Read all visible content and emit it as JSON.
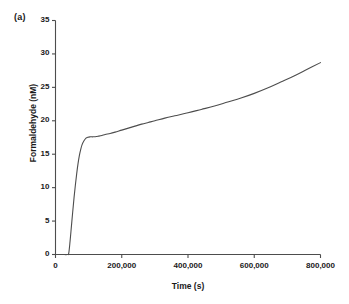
{
  "panel": {
    "label": "(a)"
  },
  "chart_data": {
    "type": "line",
    "title": "",
    "subtitle": "",
    "xlabel": "Time (s)",
    "ylabel": "Formaldehyde (nM)",
    "xlim": [
      0,
      800000
    ],
    "ylim": [
      0,
      35
    ],
    "xticks": [
      0,
      200000,
      400000,
      600000,
      800000
    ],
    "xtick_labels": [
      "0",
      "200,000",
      "400,000",
      "600,000",
      "800,000"
    ],
    "yticks": [
      0,
      5,
      10,
      15,
      20,
      25,
      30,
      35
    ],
    "ytick_labels": [
      "0",
      "5",
      "10",
      "15",
      "20",
      "25",
      "30",
      "35"
    ],
    "grid": false,
    "legend": null,
    "annotations": [],
    "line_color": "#4d4d4d",
    "line_width": 1.1,
    "series": [
      {
        "name": "Formaldehyde",
        "x": [
          0,
          20000,
          36000,
          40000,
          44000,
          48000,
          52000,
          56000,
          60000,
          64000,
          68000,
          72000,
          76000,
          80000,
          86000,
          92000,
          98000,
          104000,
          112000,
          120000,
          130000,
          140000,
          150000,
          165000,
          180000,
          200000,
          220000,
          240000,
          260000,
          280000,
          300000,
          330000,
          360000,
          400000,
          440000,
          480000,
          520000,
          560000,
          600000,
          640000,
          680000,
          720000,
          760000,
          800000
        ],
        "y": [
          0,
          0,
          0,
          0.2,
          2.0,
          4.2,
          6.4,
          8.5,
          10.4,
          12.1,
          13.6,
          14.8,
          15.7,
          16.4,
          17.0,
          17.4,
          17.55,
          17.6,
          17.6,
          17.62,
          17.7,
          17.8,
          17.95,
          18.1,
          18.3,
          18.6,
          18.9,
          19.2,
          19.5,
          19.75,
          20.0,
          20.4,
          20.75,
          21.2,
          21.7,
          22.2,
          22.8,
          23.4,
          24.1,
          24.9,
          25.8,
          26.7,
          27.7,
          28.7
        ]
      }
    ]
  }
}
